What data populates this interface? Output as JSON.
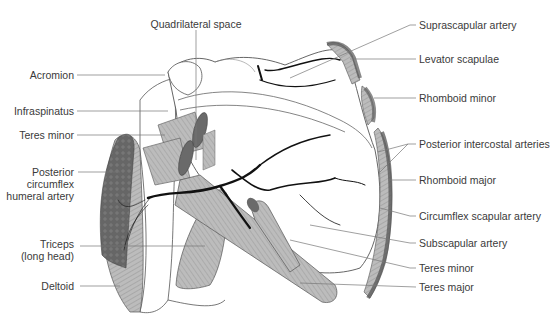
{
  "diagram": {
    "colors": {
      "muscle_fill": "#b9b9b9",
      "muscle_cut": "#6a6a6a",
      "artery": "#111111",
      "outline": "#555555",
      "leader": "#777777",
      "text": "#3a3a3a"
    },
    "labels_left": [
      {
        "id": "acromion",
        "text": "Acromion"
      },
      {
        "id": "infraspinatus",
        "text": "Infraspinatus"
      },
      {
        "id": "teres-minor-left",
        "text": "Teres minor"
      },
      {
        "id": "posterior-circumflex-humeral-artery",
        "lines": [
          "Posterior",
          "circumflex",
          "humeral artery"
        ]
      },
      {
        "id": "triceps-long-head",
        "lines": [
          "Triceps",
          "(long head)"
        ]
      },
      {
        "id": "deltoid",
        "text": "Deltoid"
      }
    ],
    "labels_top": [
      {
        "id": "quadrilateral-space",
        "text": "Quadrilateral space"
      }
    ],
    "labels_right": [
      {
        "id": "suprascapular-artery",
        "text": "Suprascapular artery"
      },
      {
        "id": "levator-scapulae",
        "text": "Levator scapulae"
      },
      {
        "id": "rhomboid-minor",
        "text": "Rhomboid minor"
      },
      {
        "id": "posterior-intercostal-arteries",
        "text": "Posterior intercostal arteries"
      },
      {
        "id": "rhomboid-major",
        "text": "Rhomboid major"
      },
      {
        "id": "circumflex-scapular-artery",
        "text": "Circumflex scapular artery"
      },
      {
        "id": "subscapular-artery",
        "text": "Subscapular artery"
      },
      {
        "id": "teres-minor-right",
        "text": "Teres minor"
      },
      {
        "id": "teres-major",
        "text": "Teres major"
      }
    ]
  }
}
